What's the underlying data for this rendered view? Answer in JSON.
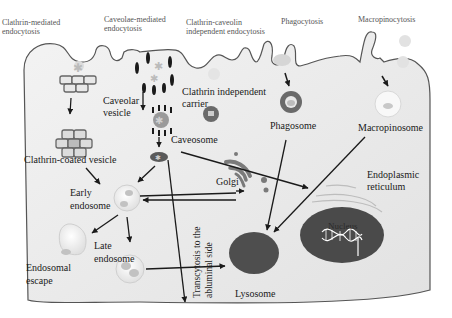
{
  "diagram": {
    "pathway_headers": [
      {
        "line1": "Clathrin-mediated",
        "line2": "endocytosis"
      },
      {
        "line1": "Caveolae-mediated",
        "line2": "endocytosis"
      },
      {
        "line1": "Clathrin-caveolin",
        "line2": "independent endocytosis"
      },
      {
        "line1": "Phagocytosis",
        "line2": ""
      },
      {
        "line1": "Macropinocytosis",
        "line2": ""
      }
    ],
    "labels": {
      "caveolar_vesicle_1": "Caveolar",
      "caveolar_vesicle_2": "vesicle",
      "clathrin_independent_1": "Clathrin independent",
      "clathrin_independent_2": "carrier",
      "phagosome": "Phagosome",
      "macropinosome": "Macropinosome",
      "clathrin_coated_vesicle": "Clathrin-coated vesicle",
      "caveosome": "Caveosome",
      "golgi": "Golgi",
      "er_1": "Endoplasmic",
      "er_2": "reticulum",
      "early_endosome_1": "Early",
      "early_endosome_2": "endosome",
      "late_endosome_1": "Late",
      "late_endosome_2": "endosome",
      "endosomal_escape_1": "Endosomal",
      "endosomal_escape_2": "escape",
      "transcytosis_1": "Transcytosis to the",
      "transcytosis_2": "abluminal side",
      "nucleus": "Nucleus",
      "lysosome": "Lysosome"
    },
    "colors": {
      "cell_fill": "#ececec",
      "membrane": "#555555",
      "organelle_dark": "#5a5a5a",
      "nucleus": "#4a4a4a",
      "vesicle_light": "#f4f4f4",
      "arrow": "#1a1a1a"
    }
  }
}
